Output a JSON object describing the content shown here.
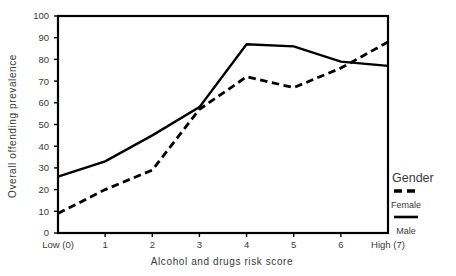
{
  "chart_data": {
    "type": "line",
    "title": "",
    "xlabel": "Alcohol and drugs risk score",
    "ylabel": "Overall offending prevalence",
    "categories": [
      "Low (0)",
      "1",
      "2",
      "3",
      "4",
      "5",
      "6",
      "High (7)"
    ],
    "x": [
      0,
      1,
      2,
      3,
      4,
      5,
      6,
      7
    ],
    "xlim": [
      0,
      7
    ],
    "ylim": [
      0,
      100
    ],
    "yticks": [
      0,
      10,
      20,
      30,
      40,
      50,
      60,
      70,
      80,
      90,
      100
    ],
    "ytick_labels": [
      "0",
      "10",
      "20",
      "30",
      "40",
      "50",
      "60",
      "70",
      "80",
      "90",
      "100"
    ],
    "grid": false,
    "legend_position": "right",
    "legend_title": "Gender",
    "series": [
      {
        "name": "Female",
        "style": "dashed",
        "color": "#000000",
        "values": [
          9,
          20,
          29,
          57,
          72,
          67,
          76,
          88
        ]
      },
      {
        "name": "Male",
        "style": "solid",
        "color": "#000000",
        "values": [
          26,
          33,
          45,
          58,
          87,
          86,
          79,
          77
        ]
      }
    ]
  },
  "legend": {
    "title": "Gender",
    "entries": [
      {
        "label": "Female",
        "style": "dashed"
      },
      {
        "label": "Male",
        "style": "solid"
      }
    ]
  },
  "colors": {
    "line": "#000000",
    "text": "#3a3a3a",
    "background": "#ffffff"
  }
}
